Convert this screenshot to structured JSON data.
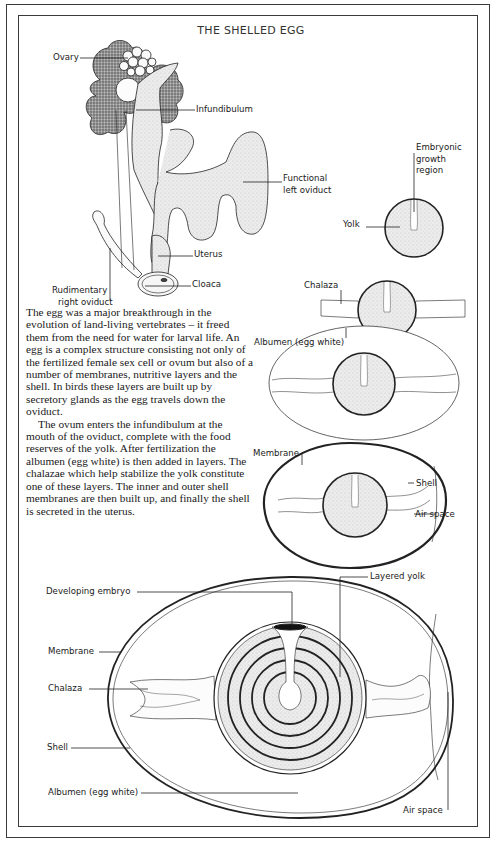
{
  "title": "THE SHELLED EGG",
  "colors": {
    "ink": "#1a1a1a",
    "yolk_fill": "#e9e9e9",
    "frame": "#3a3a3a",
    "background": "#ffffff"
  },
  "reproductive_tract_labels": {
    "ovary": "Ovary",
    "infundibulum": "Infundibulum",
    "functional_oviduct_line1": "Functional",
    "functional_oviduct_line2": "left oviduct",
    "uterus": "Uterus",
    "cloaca": "Cloaca",
    "rudimentary_line1": "Rudimentary",
    "rudimentary_line2": "right oviduct"
  },
  "stage_labels": {
    "embryonic_line1": "Embryonic",
    "embryonic_line2": "growth",
    "embryonic_line3": "region",
    "yolk": "Yolk",
    "chalaza": "Chalaza",
    "albumen": "Albumen (egg white)",
    "membrane": "Membrane",
    "shell": "Shell",
    "air_space": "Air space"
  },
  "large_egg_labels": {
    "developing_embryo": "Developing embryo",
    "layered_yolk": "Layered yolk",
    "membrane": "Membrane",
    "chalaza": "Chalaza",
    "shell": "Shell",
    "albumen": "Albumen (egg white)",
    "air_space": "Air space"
  },
  "body_text": {
    "paragraph1": "The egg was a major breakthrough in the evolution of land-living vertebrates – it freed them from the need for water for larval life. An egg is a complex structure consisting not only of the fertilized female sex cell or ovum but also of a number of membranes, nutritive layers and the shell. In birds these layers are built up by secretory glands as the egg travels down the oviduct.",
    "paragraph2": "The ovum enters the infundibulum at the mouth of the oviduct, complete with the food reserves of the yolk. After fertilization the albumen (egg white) is then added in layers. The chalazae which help stabilize the yolk constitute one of these layers. The inner and outer shell membranes are then built up, and finally the shell is secreted in the uterus."
  }
}
